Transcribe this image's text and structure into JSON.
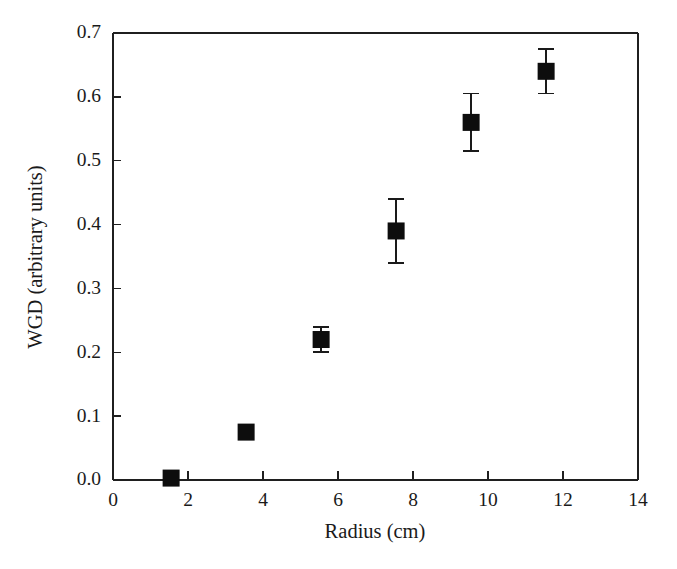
{
  "chart_data": {
    "type": "scatter",
    "title": "",
    "xlabel": "Radius (cm)",
    "ylabel": "WGD (arbitrary units)",
    "xlim": [
      0,
      14
    ],
    "ylim": [
      0.0,
      0.7
    ],
    "xticks": [
      0,
      2,
      4,
      6,
      8,
      10,
      12,
      14
    ],
    "xtick_labels": [
      "0",
      "2",
      "4",
      "6",
      "8",
      "10",
      "12",
      "14"
    ],
    "yticks": [
      0.0,
      0.1,
      0.2,
      0.3,
      0.4,
      0.5,
      0.6,
      0.7
    ],
    "ytick_labels": [
      "0.0",
      "0.1",
      "0.2",
      "0.3",
      "0.4",
      "0.5",
      "0.6",
      "0.7"
    ],
    "grid": false,
    "legend": null,
    "marker": "filled-square",
    "marker_color": "#0d0d0d",
    "error_bars": "symmetric-vertical",
    "x": [
      1.55,
      3.55,
      5.55,
      7.55,
      9.55,
      11.55
    ],
    "y": [
      0.003,
      0.075,
      0.22,
      0.39,
      0.56,
      0.64
    ],
    "yerr": [
      0.0,
      0.0,
      0.02,
      0.05,
      0.045,
      0.035
    ],
    "points": [
      {
        "x": 1.55,
        "y": 0.003,
        "yerr": 0.0
      },
      {
        "x": 3.55,
        "y": 0.075,
        "yerr": 0.0
      },
      {
        "x": 5.55,
        "y": 0.22,
        "yerr": 0.02
      },
      {
        "x": 7.55,
        "y": 0.39,
        "yerr": 0.05
      },
      {
        "x": 9.55,
        "y": 0.56,
        "yerr": 0.045
      },
      {
        "x": 11.55,
        "y": 0.64,
        "yerr": 0.035
      }
    ]
  },
  "axes": {
    "x_title": "Radius (cm)",
    "y_title": "WGD (arbitrary units)"
  }
}
